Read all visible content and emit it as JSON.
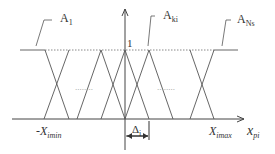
{
  "diagram": {
    "type": "fuzzy-membership-functions",
    "labels": {
      "a1": {
        "main": "A",
        "sub": "1"
      },
      "aki": {
        "main": "A",
        "sub": "ki"
      },
      "ans": {
        "main": "A",
        "sub": "Ns"
      },
      "one": "1",
      "xmin": {
        "main": "-X",
        "sub": "imin"
      },
      "xmax": {
        "main": "X",
        "sub": "imax"
      },
      "xpi": {
        "main": "x",
        "sub": "pi"
      },
      "delta": {
        "main": "Δ",
        "sub": "i"
      }
    },
    "dots_left": "........",
    "dots_right": "........",
    "colors": {
      "line": "#555555",
      "dotted": "#888888",
      "axis": "#444444"
    }
  }
}
